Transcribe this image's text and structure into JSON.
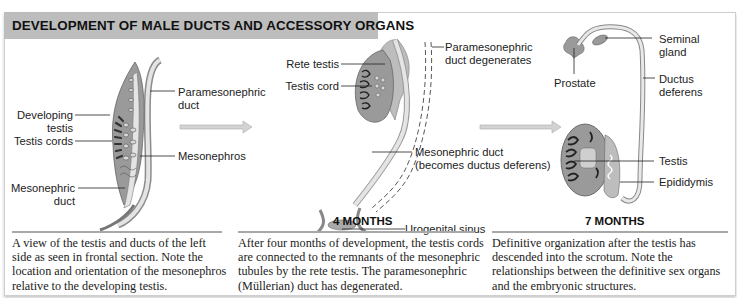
{
  "figure": {
    "title": "DEVELOPMENT OF MALE DUCTS AND ACCESSORY ORGANS",
    "colors": {
      "title_bar": "#bdbdbd",
      "organ_fill": "#9a9a9a",
      "duct_fill": "#e4e4e4",
      "arrow_fill": "#d3d3d3",
      "caption_rule": "#a8a8a8"
    }
  },
  "panels": [
    {
      "stage": "",
      "labels": {
        "paramesonephric_duct_1": "Paramesonephric",
        "paramesonephric_duct_2": "duct",
        "developing_testis_1": "Developing",
        "developing_testis_2": "testis",
        "testis_cords": "Testis cords",
        "mesonephros": "Mesonephros",
        "mesonephric_duct_1": "Mesonephric",
        "mesonephric_duct_2": "duct"
      },
      "caption": [
        "A view of the testis and ducts of the left",
        "side as seen in frontal section. Note the",
        "location and orientation of the mesonephros",
        "relative to the developing testis."
      ]
    },
    {
      "stage": "4 MONTHS",
      "labels": {
        "rete_testis": "Rete testis",
        "testis_cord": "Testis cord",
        "paramesonephric_degenerates_1": "Paramesonephric",
        "paramesonephric_degenerates_2": "duct degenerates",
        "mesonephric_duct_1": "Mesonephric duct",
        "mesonephric_duct_2": "(becomes ductus deferens)",
        "urogenital_sinus": "Urogenital sinus"
      },
      "caption": [
        "After four months of development, the testis cords",
        "are connected to the remnants of the mesonephric",
        "tubules by the rete testis. The paramesonephric",
        "(Müllerian) duct has degenerated."
      ]
    },
    {
      "stage": "7 MONTHS",
      "labels": {
        "seminal_gland_1": "Seminal",
        "seminal_gland_2": "gland",
        "prostate": "Prostate",
        "ductus_deferens_1": "Ductus",
        "ductus_deferens_2": "deferens",
        "testis": "Testis",
        "epididymis": "Epididymis"
      },
      "caption": [
        "Definitive organization after the testis has",
        "descended into the scrotum. Note the",
        "relationships between the definitive sex organs",
        "and the embryonic structures."
      ]
    }
  ]
}
